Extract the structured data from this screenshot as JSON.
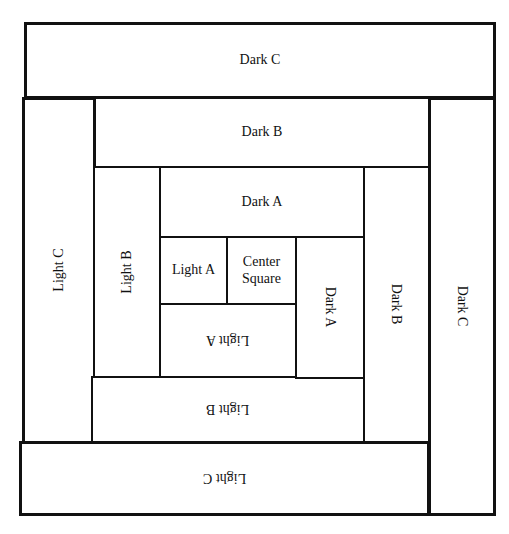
{
  "diagram": {
    "type": "log-cabin-quilt-block",
    "pieces": {
      "dark_c_top": "Dark C",
      "dark_b_top": "Dark B",
      "dark_a_top": "Dark A",
      "light_a_left": "Light A",
      "center_square_line1": "Center",
      "center_square_line2": "Square",
      "dark_a_right": "Dark A",
      "light_a_bottom": "Light A",
      "light_b_left": "Light B",
      "dark_b_right": "Dark B",
      "light_b_bottom": "Light B",
      "light_c_left": "Light C",
      "dark_c_right": "Dark C",
      "light_c_bottom": "Light C"
    },
    "colors": {
      "line": "#111111",
      "fill": "#ffffff"
    }
  }
}
